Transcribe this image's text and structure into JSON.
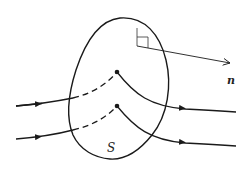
{
  "figure": {
    "surface_label": "S",
    "normal_label": "n",
    "colors": {
      "stroke": "#1a1a1a",
      "background": "#ffffff"
    },
    "elements": {
      "closed_surface": "closed surface S",
      "normal_vector": "unit normal vector n with right-angle marker",
      "field_lines": [
        {
          "id": "line-1",
          "enters": "left",
          "exits": "right",
          "point": "upper dot on surface"
        },
        {
          "id": "line-2",
          "enters": "left",
          "exits": "right",
          "point": "lower dot on surface"
        }
      ]
    }
  }
}
